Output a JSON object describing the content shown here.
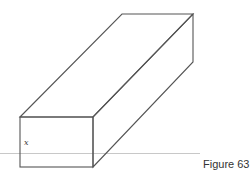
{
  "figure": {
    "caption": "Figure 63",
    "dimension_label": "x",
    "shape": "rectangular-prism",
    "colors": {
      "edge": "#555555",
      "baseline": "#c8c8c8",
      "text": "#333333"
    }
  }
}
